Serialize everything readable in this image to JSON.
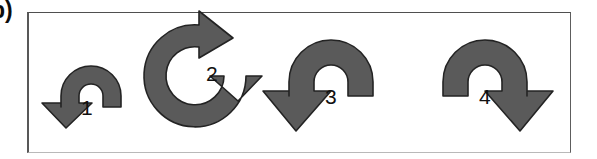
{
  "figure": {
    "panel_label": "b)",
    "background_color": "#ffffff",
    "frame": {
      "border_color": "#585858",
      "bottom_border_color": "#b9b9b9",
      "x": 27,
      "y": 12,
      "width": 544,
      "height": 141
    },
    "arrow_fill_color": "#5a5a5a",
    "arrow_stroke_color": "#1f1f1f",
    "number_color": "#111111",
    "arrows": [
      {
        "id": "arrow-1",
        "label": "1",
        "shape": "semicircular-arc-arrow",
        "sweep": "180",
        "direction": "counterclockwise",
        "arrowhead_position": "left-end",
        "arrowhead_points": "down-left",
        "tail_position": "right-end",
        "size": "small"
      },
      {
        "id": "arrow-2",
        "label": "2",
        "shape": "circular-loop-arrow",
        "sweep": "270",
        "direction": "clockwise",
        "arrowhead_position": "top",
        "arrowhead_points": "up-right",
        "tail_position": "right",
        "size": "large"
      },
      {
        "id": "arrow-3",
        "label": "3",
        "shape": "semicircular-arc-arrow",
        "sweep": "180",
        "direction": "counterclockwise",
        "arrowhead_position": "left-end",
        "arrowhead_points": "down-left",
        "tail_position": "right-end",
        "size": "medium"
      },
      {
        "id": "arrow-4",
        "label": "4",
        "shape": "semicircular-arc-arrow",
        "sweep": "180",
        "direction": "clockwise",
        "arrowhead_position": "right-end",
        "arrowhead_points": "down-right",
        "tail_position": "left-end",
        "size": "medium"
      }
    ]
  }
}
